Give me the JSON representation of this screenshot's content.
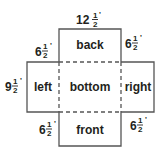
{
  "diagram": {
    "faces": {
      "back": "back",
      "left": "left",
      "bottom": "bottom",
      "right": "right",
      "front": "front"
    },
    "dimensions": {
      "top_width": {
        "whole": "12",
        "num": "1",
        "den": "2",
        "unit": "'"
      },
      "back_left_height": {
        "whole": "6",
        "num": "1",
        "den": "2",
        "unit": "'"
      },
      "back_right_height": {
        "whole": "6",
        "num": "1",
        "den": "2",
        "unit": "'"
      },
      "left_height": {
        "whole": "9",
        "num": "1",
        "den": "2",
        "unit": "'"
      },
      "front_left_height": {
        "whole": "6",
        "num": "1",
        "den": "2",
        "unit": "'"
      },
      "front_right_height": {
        "whole": "6",
        "num": "1",
        "den": "2",
        "unit": "'"
      }
    },
    "colors": {
      "line": "#555555",
      "text": "#231f20",
      "background": "#ffffff"
    }
  }
}
